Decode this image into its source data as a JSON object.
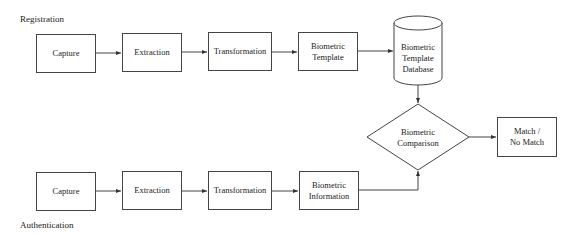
{
  "sections": {
    "registration_label": "Registration",
    "authentication_label": "Authentication"
  },
  "registration": {
    "capture": "Capture",
    "extraction": "Extraction",
    "transformation": "Transformation",
    "template_line1": "Biometric",
    "template_line2": "Template",
    "database_line1": "Biometric",
    "database_line2": "Template",
    "database_line3": "Database"
  },
  "comparison": {
    "line1": "Biometric",
    "line2": "Comparison"
  },
  "result": {
    "line1": "Match /",
    "line2": "No Match"
  },
  "authentication": {
    "capture": "Capture",
    "extraction": "Extraction",
    "transformation": "Transformation",
    "information_line1": "Biometric",
    "information_line2": "Information"
  },
  "colors": {
    "stroke": "#444444",
    "text": "#222222",
    "background": "#ffffff"
  }
}
